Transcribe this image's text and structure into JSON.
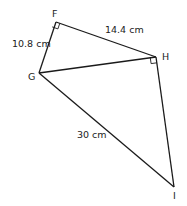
{
  "diagram": {
    "vertices": [
      {
        "id": "F",
        "label": "F",
        "x": 56,
        "y": 22
      },
      {
        "id": "G",
        "label": "G",
        "x": 39,
        "y": 73
      },
      {
        "id": "H",
        "label": "H",
        "x": 156,
        "y": 57
      },
      {
        "id": "I",
        "label": "I",
        "x": 174,
        "y": 187
      }
    ],
    "edges": [
      {
        "from": "F",
        "to": "G",
        "label": "10.8 cm"
      },
      {
        "from": "F",
        "to": "H",
        "label": "14.4 cm"
      },
      {
        "from": "G",
        "to": "H",
        "label": ""
      },
      {
        "from": "G",
        "to": "I",
        "label": "30 cm"
      },
      {
        "from": "H",
        "to": "I",
        "label": ""
      }
    ],
    "right_angles": [
      "F",
      "H"
    ],
    "labels": {
      "FG": "10.8 cm",
      "FH": "14.4 cm",
      "GI": "30 cm",
      "F": "F",
      "G": "G",
      "H": "H",
      "I": "I"
    },
    "colors": {
      "line": "#1a1a1a",
      "text": "#222222",
      "background": "#ffffff"
    }
  }
}
